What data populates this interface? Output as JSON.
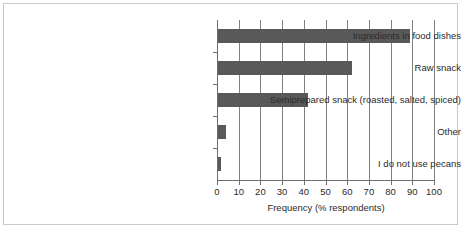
{
  "chart_data": {
    "type": "bar",
    "orientation": "horizontal",
    "title": "",
    "xlabel": "Frequency (% respondents)",
    "ylabel": "",
    "categories": [
      "Ingredients in food dishes",
      "Raw snack",
      "Semiprepared snack (roasted, salted, spiced)",
      "Other",
      "I do not use pecans"
    ],
    "values": [
      89,
      62,
      42,
      4,
      2
    ],
    "xlim": [
      0,
      100
    ],
    "xticks": [
      0,
      10,
      20,
      30,
      40,
      50,
      60,
      70,
      80,
      90,
      100
    ],
    "xtick_labels": [
      "0",
      "10",
      "20",
      "30",
      "40",
      "50",
      "60",
      "70",
      "80",
      "90",
      "100"
    ],
    "grid": "vertical",
    "legend": "none",
    "bar_color": "#595959",
    "shadow_color": "#d8d8d8",
    "axis_color": "#6e6e6e",
    "gridline_color": "#808080",
    "frame_color": "#c9c9c9",
    "background": "#ffffff"
  }
}
